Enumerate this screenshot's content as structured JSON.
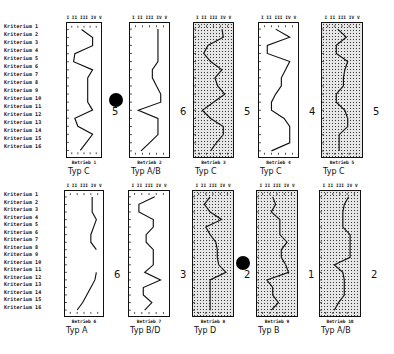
{
  "chart_data": {
    "type": "line",
    "title": "",
    "orientation": "vertical profile charts (criteria on y-axis, scale I–V on x-axis)",
    "scale_ticks": [
      "I",
      "II",
      "III",
      "IV",
      "V"
    ],
    "criteria": [
      "Kriterium 1",
      "Kriterium 2",
      "Kriterium 3",
      "Kriterium 4",
      "Kriterium 5",
      "Kriterium 6",
      "Kriterium 7",
      "Kriterium 8",
      "Kriterium 9",
      "Kriterium 10",
      "Kriterium 11",
      "Kriterium 12",
      "Kriterium 13",
      "Kriterium 14",
      "Kriterium 15",
      "Kriterium 16"
    ],
    "panels": [
      {
        "name": "Betrieb 1",
        "type": "Typ  C",
        "rank": "5",
        "shaded": false,
        "marked": false,
        "values": [
          2.6,
          4.4,
          4.4,
          1.5,
          1.3,
          4.4,
          3.6,
          3.6,
          3.6,
          3.6,
          4.4,
          1.5,
          2.0,
          4.4,
          3.4,
          2.4
        ]
      },
      {
        "name": "Betrieb 2",
        "type": "Typ  A/B",
        "rank": "6",
        "shaded": false,
        "marked": true,
        "values": [
          4.2,
          4.2,
          4.2,
          4.2,
          4.2,
          3.4,
          3.4,
          4.0,
          4.6,
          4.6,
          1.4,
          4.2,
          4.2,
          4.2,
          3.0,
          1.8
        ]
      },
      {
        "name": "Betrieb 3",
        "type": "Typ  C",
        "rank": "5",
        "shaded": true,
        "marked": false,
        "values": [
          4.2,
          4.4,
          2.2,
          1.6,
          2.6,
          4.2,
          3.2,
          3.6,
          4.6,
          3.0,
          1.4,
          2.6,
          4.4,
          4.4,
          3.4,
          2.6
        ]
      },
      {
        "name": "Betrieb 4",
        "type": "Typ  C",
        "rank": "4",
        "shaded": false,
        "marked": false,
        "values": [
          2.6,
          4.6,
          1.4,
          1.4,
          4.6,
          4.0,
          3.4,
          3.4,
          2.6,
          2.0,
          2.0,
          3.8,
          4.6,
          4.6,
          4.6,
          2.0
        ]
      },
      {
        "name": "Betrieb 5",
        "type": "Typ  C",
        "rank": "5",
        "shaded": true,
        "marked": false,
        "values": [
          2.4,
          3.6,
          2.2,
          2.2,
          3.8,
          3.4,
          3.2,
          3.2,
          2.2,
          2.2,
          3.4,
          3.8,
          3.8,
          2.6,
          2.6,
          2.6
        ]
      },
      {
        "name": "Betrieb 6",
        "type": "Typ  A",
        "rank": "6",
        "shaded": false,
        "marked": false,
        "values": [
          4.2,
          4.2,
          4.2,
          4.8,
          4.4,
          4.0,
          4.0,
          4.8,
          null,
          null,
          4.8,
          4.6,
          4.0,
          3.4,
          2.8,
          2.0
        ]
      },
      {
        "name": "Betrieb 7",
        "type": "Typ  B/D",
        "rank": "3",
        "shaded": false,
        "marked": false,
        "values": [
          3.8,
          1.6,
          1.6,
          3.6,
          3.6,
          2.6,
          2.6,
          3.6,
          3.6,
          3.6,
          2.4,
          4.6,
          2.2,
          2.2,
          3.4,
          2.4
        ]
      },
      {
        "name": "Betrieb 8",
        "type": "Typ  D",
        "rank": "2",
        "shaded": true,
        "marked": false,
        "values": [
          2.6,
          1.8,
          2.6,
          4.2,
          2.0,
          2.6,
          3.4,
          3.6,
          3.6,
          3.8,
          4.8,
          2.6,
          2.6,
          2.6,
          2.6,
          2.6
        ]
      },
      {
        "name": "Betrieb 9",
        "type": "Typ  B",
        "rank": "1",
        "shaded": true,
        "marked": true,
        "values": [
          2.4,
          2.8,
          2.2,
          3.4,
          3.4,
          3.4,
          4.4,
          3.6,
          3.6,
          4.2,
          4.6,
          1.6,
          2.4,
          2.4,
          3.2,
          2.2
        ]
      },
      {
        "name": "Betrieb 10",
        "type": "Typ  A/B",
        "rank": "2",
        "shaded": true,
        "marked": false,
        "values": [
          4.2,
          3.6,
          3.4,
          3.4,
          3.4,
          4.4,
          4.4,
          4.4,
          4.4,
          2.2,
          3.4,
          3.6,
          3.6,
          3.6,
          2.8,
          2.2
        ]
      }
    ],
    "xlabel": "",
    "ylabel": "",
    "grid": false,
    "legend": "none"
  },
  "labels": {
    "criteria": [
      "Kriterium  1",
      "Kriterium  2",
      "Kriterium  3",
      "Kriterium  4",
      "Kriterium  5",
      "Kriterium  6",
      "Kriterium  7",
      "Kriterium  8",
      "Kriterium  9",
      "Kriterium 10",
      "Kriterium 11",
      "Kriterium 12",
      "Kriterium 13",
      "Kriterium 14",
      "Kriterium 15",
      "Kriterium 16"
    ],
    "scale": "I  II III IV  V",
    "panels": [
      {
        "betrieb": "Betrieb 1",
        "typ": "Typ  C",
        "rank": "5"
      },
      {
        "betrieb": "Betrieb 2",
        "typ": "Typ  A/B",
        "rank": "6"
      },
      {
        "betrieb": "Betrieb 3",
        "typ": "Typ  C",
        "rank": "5"
      },
      {
        "betrieb": "Betrieb 4",
        "typ": "Typ  C",
        "rank": "4"
      },
      {
        "betrieb": "Betrieb 5",
        "typ": "Typ  C",
        "rank": "5"
      },
      {
        "betrieb": "Betrieb 6",
        "typ": "Typ  A",
        "rank": "6"
      },
      {
        "betrieb": "Betrieb 7",
        "typ": "Typ  B/D",
        "rank": "3"
      },
      {
        "betrieb": "Betrieb 8",
        "typ": "Typ  D",
        "rank": "2"
      },
      {
        "betrieb": "Betrieb 9",
        "typ": "Typ  B",
        "rank": "1"
      },
      {
        "betrieb": "Betrieb 10",
        "typ": "Typ  A/B",
        "rank": "2"
      }
    ]
  }
}
